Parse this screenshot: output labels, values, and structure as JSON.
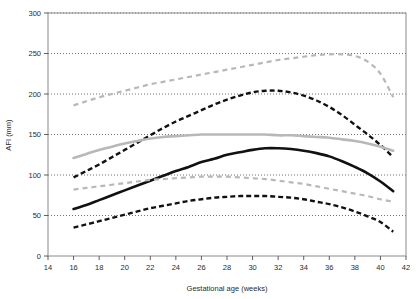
{
  "chart_data": {
    "type": "line",
    "title": "",
    "xlabel": "Gestational age (weeks)",
    "ylabel": "AFI (mm)",
    "xlim": [
      14,
      42
    ],
    "ylim": [
      0,
      300
    ],
    "xticks": [
      14,
      16,
      18,
      20,
      22,
      24,
      26,
      28,
      30,
      32,
      34,
      36,
      38,
      40,
      42
    ],
    "yticks": [
      0,
      50,
      100,
      150,
      200,
      250,
      300
    ],
    "xtick_labels": [
      "14",
      "16",
      "18",
      "20",
      "22",
      "24",
      "26",
      "28",
      "30",
      "32",
      "34",
      "36",
      "38",
      "40",
      "42"
    ],
    "ytick_labels": [
      "0",
      "50",
      "100",
      "150",
      "200",
      "250",
      "300"
    ],
    "grid": "horizontal-dotted",
    "legend": "none",
    "plot_border": true,
    "colors": {
      "gray": "#b8b8b8",
      "black": "#111111",
      "gridline": "#4d4d4d",
      "axis": "#8a8a8a"
    },
    "series": [
      {
        "name": "gray-upper-dashed",
        "color": "#b8b8b8",
        "style": "dashed",
        "width": 2.2,
        "x": [
          16,
          17,
          18,
          19,
          20,
          21,
          22,
          23,
          24,
          25,
          26,
          27,
          28,
          29,
          30,
          31,
          32,
          33,
          34,
          35,
          36,
          37,
          38,
          39,
          40,
          41
        ],
        "values": [
          186,
          191,
          196,
          200,
          204,
          208,
          212,
          215,
          218,
          221,
          224,
          227,
          230,
          233,
          236,
          239,
          242,
          244,
          246,
          248,
          249,
          249,
          247,
          240,
          225,
          196
        ]
      },
      {
        "name": "black-upper-dashed",
        "color": "#111111",
        "style": "dashed",
        "width": 2.4,
        "x": [
          16,
          17,
          18,
          19,
          20,
          21,
          22,
          23,
          24,
          25,
          26,
          27,
          28,
          29,
          30,
          31,
          32,
          33,
          34,
          35,
          36,
          37,
          38,
          39,
          40,
          41
        ],
        "values": [
          97,
          105,
          113,
          122,
          131,
          140,
          149,
          158,
          166,
          173,
          180,
          187,
          193,
          198,
          202,
          204,
          204,
          202,
          198,
          192,
          184,
          174,
          162,
          150,
          137,
          122
        ]
      },
      {
        "name": "gray-median-solid",
        "color": "#b8b8b8",
        "style": "solid",
        "width": 2.6,
        "x": [
          16,
          17,
          18,
          19,
          20,
          21,
          22,
          23,
          24,
          25,
          26,
          27,
          28,
          29,
          30,
          31,
          32,
          33,
          34,
          35,
          36,
          37,
          38,
          39,
          40,
          41
        ],
        "values": [
          121,
          126,
          131,
          135,
          139,
          142,
          145,
          147,
          148,
          149,
          150,
          150,
          150,
          150,
          150,
          150,
          149,
          149,
          148,
          147,
          146,
          144,
          142,
          139,
          135,
          130
        ]
      },
      {
        "name": "black-median-solid",
        "color": "#111111",
        "style": "solid",
        "width": 2.6,
        "x": [
          16,
          17,
          18,
          19,
          20,
          21,
          22,
          23,
          24,
          25,
          26,
          27,
          28,
          29,
          30,
          31,
          32,
          33,
          34,
          35,
          36,
          37,
          38,
          39,
          40,
          41
        ],
        "values": [
          58,
          63,
          69,
          75,
          81,
          87,
          93,
          99,
          105,
          110,
          116,
          120,
          125,
          128,
          131,
          133,
          133,
          132,
          130,
          127,
          123,
          117,
          110,
          102,
          92,
          80
        ]
      },
      {
        "name": "gray-lower-dashed",
        "color": "#b8b8b8",
        "style": "dashed",
        "width": 2.2,
        "x": [
          16,
          17,
          18,
          19,
          20,
          21,
          22,
          23,
          24,
          25,
          26,
          27,
          28,
          29,
          30,
          31,
          32,
          33,
          34,
          35,
          36,
          37,
          38,
          39,
          40,
          41
        ],
        "values": [
          82,
          84,
          86,
          88,
          90,
          92,
          94,
          95,
          96,
          97,
          98,
          98,
          98,
          97,
          96,
          95,
          93,
          91,
          89,
          86,
          83,
          80,
          77,
          74,
          70,
          67
        ]
      },
      {
        "name": "black-lower-dashed",
        "color": "#111111",
        "style": "dashed",
        "width": 2.4,
        "x": [
          16,
          17,
          18,
          19,
          20,
          21,
          22,
          23,
          24,
          25,
          26,
          27,
          28,
          29,
          30,
          31,
          32,
          33,
          34,
          35,
          36,
          37,
          38,
          39,
          40,
          41
        ],
        "values": [
          35,
          39,
          43,
          47,
          51,
          55,
          59,
          62,
          65,
          68,
          70,
          72,
          73,
          74,
          74,
          74,
          73,
          72,
          70,
          67,
          64,
          60,
          55,
          49,
          42,
          30
        ]
      }
    ]
  }
}
